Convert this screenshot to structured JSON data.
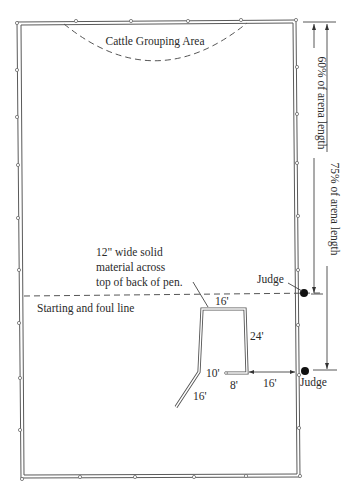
{
  "diagram": {
    "type": "arena-layout",
    "labels": {
      "grouping_area": "Cattle Grouping Area",
      "foul_line": "Starting and foul line",
      "note_line1": "12\" wide solid",
      "note_line2": "material across",
      "note_line3": "top of back of pen.",
      "pct60": "60% of arena length",
      "pct75": "75% of arena length",
      "judge_top": "Judge",
      "judge_bottom": "Judge"
    },
    "pen_dimensions": {
      "back_width": "16'",
      "side_length": "24'",
      "gate_opening": "10'",
      "gate_stub": "8'",
      "wing": "16'",
      "judge_distance": "16'"
    },
    "colors": {
      "line": "#555555",
      "judge_marker": "#111111",
      "background": "#ffffff"
    }
  }
}
